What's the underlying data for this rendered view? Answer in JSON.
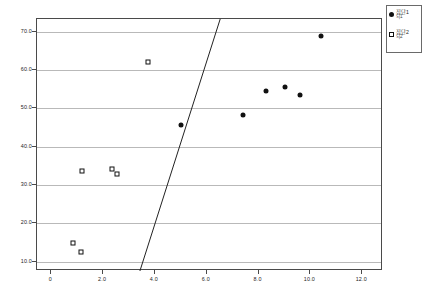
{
  "chart_data": {
    "type": "scatter",
    "title": "",
    "xlabel": "",
    "ylabel": "",
    "xlim": [
      -0.55,
      12.8
    ],
    "ylim": [
      7.6,
      73.3
    ],
    "grid": "horizontal",
    "legend_position": "top-right-outside",
    "xticks": [
      "0",
      "2.0",
      "4.0",
      "6.0",
      "8.0",
      "10.0",
      "12.0"
    ],
    "xtick_values": [
      0,
      2,
      4,
      6,
      8,
      10,
      12
    ],
    "yticks": [
      "10.0",
      "20.0",
      "30.0",
      "40.0",
      "50.0",
      "60.0",
      "70.0"
    ],
    "ytick_values": [
      10,
      20,
      30,
      40,
      50,
      60,
      70
    ],
    "series": [
      {
        "name": "group-1",
        "label": "집단1",
        "sublabel": "뇌1",
        "marker": "filled-circle",
        "color": "#111111",
        "points": [
          {
            "x": 5.0,
            "y": 45.8
          },
          {
            "x": 7.4,
            "y": 48.3
          },
          {
            "x": 8.3,
            "y": 54.5
          },
          {
            "x": 9.0,
            "y": 55.5
          },
          {
            "x": 9.6,
            "y": 53.5
          },
          {
            "x": 10.4,
            "y": 69.0
          }
        ]
      },
      {
        "name": "group-2",
        "label": "집단2",
        "sublabel": "뇌2",
        "marker": "open-square",
        "color": "#111111",
        "points": [
          {
            "x": 0.85,
            "y": 15.0
          },
          {
            "x": 1.15,
            "y": 12.5
          },
          {
            "x": 1.2,
            "y": 33.8
          },
          {
            "x": 2.35,
            "y": 34.3
          },
          {
            "x": 2.55,
            "y": 32.8
          },
          {
            "x": 3.75,
            "y": 62.0
          }
        ]
      }
    ],
    "annotations": [
      {
        "name": "discriminant-line",
        "type": "line",
        "x1": 3.42,
        "y1": 7.6,
        "x2": 6.52,
        "y2": 73.3,
        "color": "#222222"
      }
    ]
  },
  "legend": {
    "entries": [
      {
        "label": "집단1",
        "sublabel": "뇌1",
        "marker": "filled-circle"
      },
      {
        "label": "집단2",
        "sublabel": "뇌2",
        "marker": "open-square"
      }
    ]
  }
}
